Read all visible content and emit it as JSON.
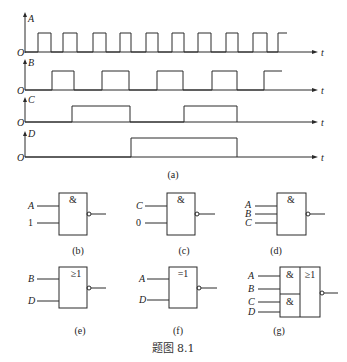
{
  "figure": {
    "caption": "题图 8.1",
    "stroke_color": "#2a2a2a"
  },
  "timing": {
    "sublabel": "(a)",
    "origin_label": "O",
    "time_label": "t",
    "signals": [
      {
        "name": "A",
        "pulses": [
          [
            38,
            51
          ],
          [
            63,
            77
          ],
          [
            93,
            106
          ],
          [
            120,
            131
          ],
          [
            146,
            158
          ],
          [
            172,
            184
          ],
          [
            198,
            211
          ],
          [
            226,
            238
          ],
          [
            253,
            267
          ],
          [
            278,
            287
          ]
        ]
      },
      {
        "name": "B",
        "pulses": [
          [
            52,
            74
          ],
          [
            102,
            129
          ],
          [
            157,
            183
          ],
          [
            212,
            237
          ],
          [
            264,
            282
          ]
        ]
      },
      {
        "name": "C",
        "pulses": [
          [
            72,
            130
          ],
          [
            184,
            237
          ]
        ]
      },
      {
        "name": "D",
        "pulses": [
          [
            131,
            237
          ]
        ]
      }
    ]
  },
  "gates": {
    "b": {
      "sublabel": "(b)",
      "symbol": "&",
      "inputs": [
        "A",
        "1"
      ]
    },
    "c": {
      "sublabel": "(c)",
      "symbol": "&",
      "inputs": [
        "C",
        "0"
      ]
    },
    "d": {
      "sublabel": "(d)",
      "symbol": "&",
      "inputs": [
        "A",
        "B",
        "C"
      ]
    },
    "e": {
      "sublabel": "(e)",
      "symbol": "≥1",
      "inputs": [
        "B",
        "D"
      ]
    },
    "f": {
      "sublabel": "(f)",
      "symbol": "=1",
      "inputs": [
        "A",
        "D"
      ]
    },
    "g": {
      "sublabel": "(g)",
      "symbol_and_top": "&",
      "symbol_and_bottom": "&",
      "symbol_or": "≥1",
      "inputs": [
        "A",
        "B",
        "C",
        "D"
      ]
    }
  }
}
